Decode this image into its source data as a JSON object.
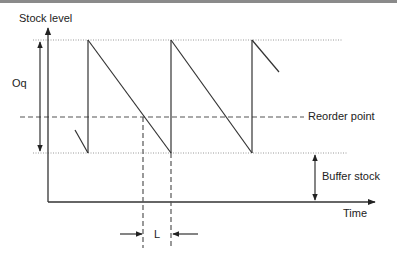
{
  "diagram": {
    "labels": {
      "y_axis": "Stock level",
      "x_axis": "Time",
      "order_quantity": "Oq",
      "reorder_point": "Reorder point",
      "buffer_stock": "Buffer stock",
      "lead_time": "L"
    },
    "colors": {
      "line": "#333333",
      "dotted": "#999999",
      "dashed": "#555555",
      "top_rule": "#8a8a8a"
    },
    "levels": {
      "max_stock_y": 40,
      "reorder_point_y": 117,
      "buffer_stock_y": 153,
      "x_axis_y": 202
    },
    "cycles": [
      {
        "replenish_x": 88,
        "empty_x": 171
      },
      {
        "replenish_x": 171,
        "empty_x": 252
      },
      {
        "replenish_x": 252,
        "partial_end_x": 279
      }
    ],
    "lead_time_markers": {
      "order_x": 143,
      "arrival_x": 171
    }
  }
}
